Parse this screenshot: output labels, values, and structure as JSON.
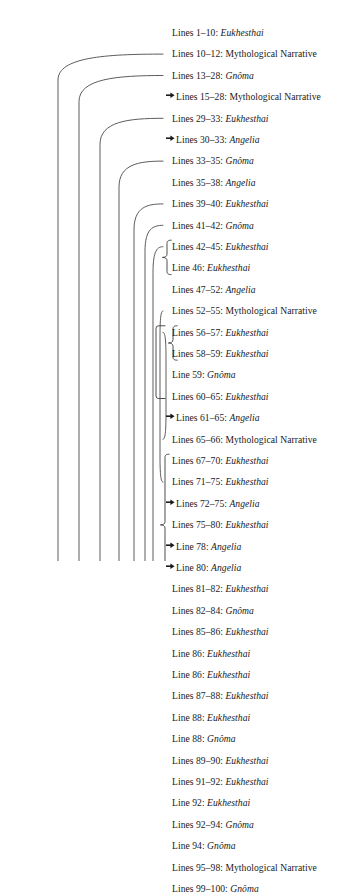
{
  "figure": {
    "type": "ring-composition-diagram",
    "line_start_x": 172,
    "first_row_y": 22,
    "row_height": 21.4,
    "stroke_color": "#4a4a4a",
    "text_color": "#1a1a1a"
  },
  "rows": [
    {
      "label": "Lines 1–10: ",
      "term": "Eukhesthai",
      "term_italic": true,
      "arrow": false
    },
    {
      "label": "Lines 10–12: ",
      "term": "Mythological Narrative",
      "term_italic": false,
      "arrow": false
    },
    {
      "label": "Lines 13–28: ",
      "term": "Gnôma",
      "term_italic": true,
      "arrow": false
    },
    {
      "label": "Lines 15–28: ",
      "term": "Mythological Narrative",
      "term_italic": false,
      "arrow": true
    },
    {
      "label": "Lines 29–33: ",
      "term": "Eukhesthai",
      "term_italic": true,
      "arrow": false
    },
    {
      "label": "Lines 30–33: ",
      "term": "Angelia",
      "term_italic": true,
      "arrow": true
    },
    {
      "label": "Lines 33–35: ",
      "term": "Gnôma",
      "term_italic": true,
      "arrow": false
    },
    {
      "label": "Lines 35–38: ",
      "term": "Angelia",
      "term_italic": true,
      "arrow": false
    },
    {
      "label": "Lines 39–40: ",
      "term": "Eukhesthai",
      "term_italic": true,
      "arrow": false
    },
    {
      "label": "Lines 41–42: ",
      "term": "Gnôma",
      "term_italic": true,
      "arrow": false
    },
    {
      "label": "Lines 42–45: ",
      "term": "Eukhesthai",
      "term_italic": true,
      "arrow": false
    },
    {
      "label": "Line 46: ",
      "term": "Eukhesthai",
      "term_italic": true,
      "arrow": false
    },
    {
      "label": "Lines 47–52: ",
      "term": "Angelia",
      "term_italic": true,
      "arrow": false
    },
    {
      "label": "Lines 52–55: ",
      "term": "Mythological Narrative",
      "term_italic": false,
      "arrow": false
    },
    {
      "label": "Lines 56–57: ",
      "term": "Eukhesthai",
      "term_italic": true,
      "arrow": false
    },
    {
      "label": "Lines 58–59: ",
      "term": "Eukhesthai",
      "term_italic": true,
      "arrow": false
    },
    {
      "label": "Line 59: ",
      "term": "Gnôma",
      "term_italic": true,
      "arrow": false
    },
    {
      "label": "Lines 60–65: ",
      "term": "Eukhesthai",
      "term_italic": true,
      "arrow": false
    },
    {
      "label": "Lines 61–65: ",
      "term": "Angelia",
      "term_italic": true,
      "arrow": true
    },
    {
      "label": "Lines 65–66: ",
      "term": "Mythological Narrative",
      "term_italic": false,
      "arrow": false
    },
    {
      "label": "Lines 67–70: ",
      "term": "Eukhesthai",
      "term_italic": true,
      "arrow": false
    },
    {
      "label": "Lines 71–75: ",
      "term": "Eukhesthai",
      "term_italic": true,
      "arrow": false
    },
    {
      "label": "Lines 72–75: ",
      "term": "Angelia",
      "term_italic": true,
      "arrow": true
    },
    {
      "label": "Lines 75–80: ",
      "term": "Eukhesthai",
      "term_italic": true,
      "arrow": false
    },
    {
      "label": "Line 78: ",
      "term": "Angelia",
      "term_italic": true,
      "arrow": true
    },
    {
      "label": "Line 80: ",
      "term": "Angelia",
      "term_italic": true,
      "arrow": true
    },
    {
      "label": "Lines 81–82: ",
      "term": "Eukhesthai",
      "term_italic": true,
      "arrow": false
    },
    {
      "label": "Lines 82–84: ",
      "term": "Gnôma",
      "term_italic": true,
      "arrow": false
    },
    {
      "label": "Lines 85–86: ",
      "term": "Eukhesthai",
      "term_italic": true,
      "arrow": false
    },
    {
      "label": "Line 86: ",
      "term": "Eukhesthai",
      "term_italic": true,
      "arrow": false
    },
    {
      "label": "Line 86: ",
      "term": "Eukhesthai",
      "term_italic": true,
      "arrow": false
    },
    {
      "label": "Lines 87–88: ",
      "term": "Eukhesthai",
      "term_italic": true,
      "arrow": false
    },
    {
      "label": "Line 88: ",
      "term": "Eukhesthai",
      "term_italic": true,
      "arrow": false
    },
    {
      "label": "Line 88: ",
      "term": "Gnôma",
      "term_italic": true,
      "arrow": false
    },
    {
      "label": "Lines 89–90: ",
      "term": "Eukhesthai",
      "term_italic": true,
      "arrow": false
    },
    {
      "label": "Lines 91–92: ",
      "term": "Eukhesthai",
      "term_italic": true,
      "arrow": false
    },
    {
      "label": "Line 92: ",
      "term": "Eukhesthai",
      "term_italic": true,
      "arrow": false
    },
    {
      "label": "Lines 92–94: ",
      "term": "Gnôma",
      "term_italic": true,
      "arrow": false
    },
    {
      "label": "Line 94: ",
      "term": "Gnôma",
      "term_italic": true,
      "arrow": false
    },
    {
      "label": "Lines 95–98: ",
      "term": "Mythological Narrative",
      "term_italic": false,
      "arrow": false
    },
    {
      "label": "Lines 99–100: ",
      "term": "Gnôma",
      "term_italic": true,
      "arrow": false
    }
  ],
  "arcs": [
    {
      "top_row": 1,
      "bottom_row": 39,
      "x": 58
    },
    {
      "top_row": 2,
      "bottom_row": 38,
      "x": 79
    },
    {
      "top_row": 4,
      "bottom_row": 37,
      "x": 100
    },
    {
      "top_row": 6,
      "bottom_row": 35,
      "x": 119
    },
    {
      "top_row": 8,
      "bottom_row": 33,
      "x": 134
    },
    {
      "top_row": 9,
      "bottom_row": 30,
      "x": 145
    },
    {
      "top_row": 10,
      "bottom_row": 27,
      "x": 153
    },
    {
      "top_row": 13,
      "bottom_row": 21,
      "x": 160
    },
    {
      "top_row": 14,
      "bottom_row": 19,
      "x": 166
    }
  ],
  "braces": [
    {
      "first_row": 10,
      "last_row": 11,
      "x": 167
    },
    {
      "first_row": 14,
      "last_row": 15,
      "x": 173
    },
    {
      "first_row": 20,
      "last_row": 26,
      "x": 165
    },
    {
      "first_row": 28,
      "last_row": 32,
      "x": 165
    },
    {
      "first_row": 34,
      "last_row": 36,
      "x": 165
    },
    {
      "first_row": 37,
      "last_row": 38,
      "x": 167
    }
  ],
  "bracket": {
    "first_row": 14,
    "last_row": 17,
    "x": 156
  }
}
